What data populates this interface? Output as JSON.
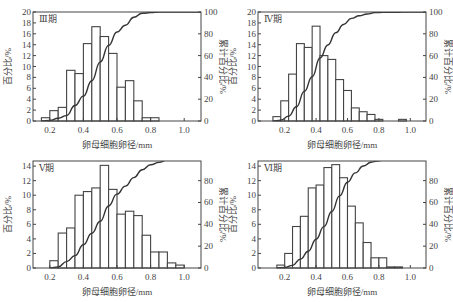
{
  "chart_data": [
    {
      "type": "bar",
      "panel_label": "Ⅲ期",
      "title": "Ⅲ期",
      "xlabel": "卵母细胞卵径/mm",
      "ylabel": "百分比/%",
      "ylabel_right": "累计百分比/%",
      "xlim": [
        0.1,
        1.1
      ],
      "ylim": [
        0,
        20
      ],
      "ylim_right": [
        0,
        100
      ],
      "xticks": [
        "0.2",
        "0.4",
        "0.6",
        "0.8",
        "1.0"
      ],
      "yticks": [
        "0",
        "2",
        "4",
        "6",
        "8",
        "10",
        "12",
        "14",
        "16",
        "18",
        "20"
      ],
      "yticks_right": [
        "0",
        "20",
        "40",
        "60",
        "80",
        "100"
      ],
      "bin_width": 0.05,
      "bins_left": [
        0.15,
        0.2,
        0.25,
        0.3,
        0.35,
        0.4,
        0.45,
        0.5,
        0.55,
        0.6,
        0.65,
        0.7,
        0.75,
        0.8
      ],
      "values": [
        0.6,
        1.9,
        2.5,
        9.3,
        8.7,
        14.2,
        17.3,
        15.5,
        12.4,
        6.2,
        7.4,
        3.7,
        0.6,
        0.6
      ],
      "series": [
        {
          "name": "百分比/%",
          "type": "bar",
          "axis": "left"
        },
        {
          "name": "累计百分比/%",
          "type": "line",
          "axis": "right"
        }
      ],
      "grid": false,
      "frame": {
        "x": 33,
        "y": 12,
        "w": 168,
        "h": 109
      }
    },
    {
      "type": "bar",
      "panel_label": "Ⅳ期",
      "title": "Ⅳ期",
      "xlabel": "卵母细胞卵径/mm",
      "ylabel": "百分比/%",
      "ylabel_right": "累计百分比/%",
      "xlim": [
        0.03,
        1.1
      ],
      "ylim": [
        0,
        20
      ],
      "ylim_right": [
        0,
        100
      ],
      "xticks": [
        "0.2",
        "0.4",
        "0.6",
        "0.8",
        "1.0"
      ],
      "yticks": [
        "0",
        "2",
        "4",
        "6",
        "8",
        "10",
        "12",
        "14",
        "16",
        "18",
        "20"
      ],
      "yticks_right": [
        "0",
        "20",
        "40",
        "60",
        "80",
        "100"
      ],
      "bin_width": 0.05,
      "bins_left": [
        0.125,
        0.175,
        0.225,
        0.275,
        0.325,
        0.375,
        0.425,
        0.475,
        0.525,
        0.575,
        0.625,
        0.675,
        0.725,
        0.775,
        0.825,
        0.875,
        0.925
      ],
      "values": [
        0.8,
        3.7,
        8.6,
        14.2,
        13.5,
        17.4,
        12.0,
        11.3,
        7.6,
        5.6,
        2.4,
        1.7,
        1.2,
        0.3,
        0,
        0,
        0.3
      ],
      "series": [
        {
          "name": "百分比/%",
          "type": "bar",
          "axis": "left"
        },
        {
          "name": "累计百分比/%",
          "type": "line",
          "axis": "right"
        }
      ],
      "grid": false,
      "frame": {
        "x": 258,
        "y": 12,
        "w": 168,
        "h": 109
      }
    },
    {
      "type": "bar",
      "panel_label": "Ⅴ期",
      "title": "Ⅴ期",
      "xlabel": "卵母细胞卵径/mm",
      "ylabel": "百分比/%",
      "ylabel_right": "累计百分比/%",
      "xlim": [
        0.1,
        1.1
      ],
      "ylim": [
        0,
        14.7
      ],
      "ylim_right": [
        0,
        98
      ],
      "xticks": [
        "0.2",
        "0.4",
        "0.6",
        "0.8",
        "1.0"
      ],
      "yticks": [
        "0",
        "2",
        "4",
        "6",
        "8",
        "10",
        "12",
        "14"
      ],
      "yticks_right": [
        "0",
        "20",
        "40",
        "60",
        "80"
      ],
      "bin_width": 0.05,
      "bins_left": [
        0.2,
        0.25,
        0.3,
        0.35,
        0.4,
        0.45,
        0.5,
        0.55,
        0.6,
        0.65,
        0.7,
        0.75,
        0.8,
        0.85,
        0.9,
        0.95
      ],
      "values": [
        1.0,
        4.8,
        5.5,
        10.0,
        10.5,
        11.0,
        14.1,
        10.8,
        7.4,
        7.8,
        7.2,
        4.5,
        2.2,
        2.2,
        0.7,
        0.4
      ],
      "series": [
        {
          "name": "百分比/%",
          "type": "bar",
          "axis": "left"
        },
        {
          "name": "累计百分比/%",
          "type": "line",
          "axis": "right"
        }
      ],
      "grid": false,
      "frame": {
        "x": 33,
        "y": 161,
        "w": 168,
        "h": 107
      }
    },
    {
      "type": "bar",
      "panel_label": "Ⅵ期",
      "title": "Ⅵ期",
      "xlabel": "卵母细胞卵径/mm",
      "ylabel": "百分比/%",
      "ylabel_right": "累计百分比/%",
      "xlim": [
        0.03,
        1.1
      ],
      "ylim": [
        0,
        14.7
      ],
      "ylim_right": [
        0,
        98
      ],
      "xticks": [
        "0.2",
        "0.4",
        "0.6",
        "0.8",
        "1.0"
      ],
      "yticks": [
        "0",
        "2",
        "4",
        "6",
        "8",
        "10",
        "12",
        "14"
      ],
      "yticks_right": [
        "0",
        "20",
        "40",
        "60",
        "80"
      ],
      "bin_width": 0.05,
      "bins_left": [
        0.15,
        0.2,
        0.25,
        0.3,
        0.35,
        0.4,
        0.45,
        0.5,
        0.55,
        0.6,
        0.65,
        0.7,
        0.75,
        0.8,
        0.85,
        0.9
      ],
      "values": [
        0.4,
        2.0,
        5.7,
        7.1,
        11.0,
        11.4,
        13.8,
        14.2,
        12.4,
        8.5,
        6.2,
        3.5,
        1.4,
        1.4,
        0.15,
        0.15
      ],
      "series": [
        {
          "name": "百分比/%",
          "type": "bar",
          "axis": "left"
        },
        {
          "name": "累计百分比/%",
          "type": "line",
          "axis": "right"
        }
      ],
      "grid": false,
      "frame": {
        "x": 258,
        "y": 161,
        "w": 168,
        "h": 107
      }
    }
  ]
}
